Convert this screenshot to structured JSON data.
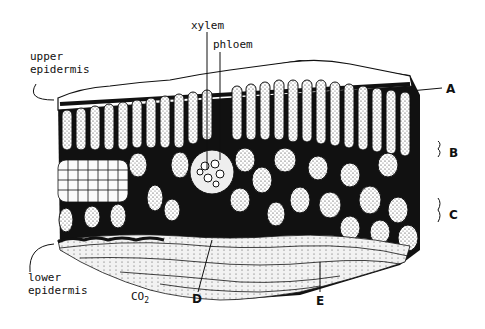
{
  "diagram": {
    "labels": {
      "upper_epidermis_line1": "upper",
      "upper_epidermis_line2": "epidermis",
      "xylem": "xylem",
      "phloem": "phloem",
      "lower_epidermis_line1": "lower",
      "lower_epidermis_line2": "epidermis",
      "co2_main": "CO",
      "co2_sub": "2",
      "A": "A",
      "B": "B",
      "C": "C",
      "D": "D",
      "E": "E"
    },
    "colors": {
      "ink": "#111111",
      "background": "#ffffff"
    }
  }
}
